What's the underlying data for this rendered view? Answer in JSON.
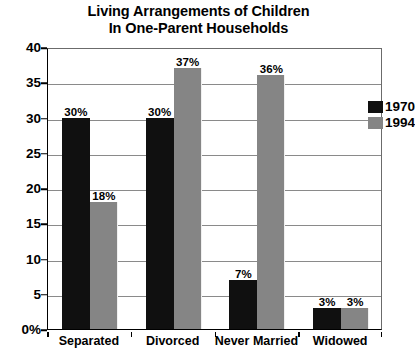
{
  "chart_data": {
    "type": "bar",
    "title": "Living Arrangements of Children In One-Parent Households",
    "title_lines": [
      "Living Arrangements of Children",
      "In One-Parent Households"
    ],
    "xlabel": "",
    "ylabel": "",
    "ylim": [
      0,
      40
    ],
    "grid": true,
    "legend_position": "top-right",
    "categories": [
      "Separated",
      "Divorced",
      "Never Married",
      "Widowed"
    ],
    "ytick_labels": [
      "0%",
      "5",
      "10",
      "15",
      "20",
      "25",
      "30",
      "35",
      "40"
    ],
    "ytick_values": [
      0,
      5,
      10,
      15,
      20,
      25,
      30,
      35,
      40
    ],
    "series": [
      {
        "name": "1970",
        "color": "#101010",
        "values": [
          30,
          30,
          7,
          3
        ],
        "data_labels": [
          "30%",
          "30%",
          "7%",
          "3%"
        ]
      },
      {
        "name": "1994",
        "color": "#858585",
        "values": [
          18,
          37,
          36,
          3
        ],
        "data_labels": [
          "18%",
          "37%",
          "36%",
          "3%"
        ]
      }
    ]
  },
  "legend": {
    "items": [
      {
        "label": "1970",
        "color": "#101010"
      },
      {
        "label": "1994",
        "color": "#858585"
      }
    ]
  }
}
